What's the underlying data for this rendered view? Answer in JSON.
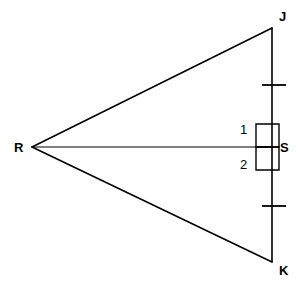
{
  "figure": {
    "type": "geometry-diagram",
    "background_color": "#ffffff",
    "stroke_color": "#000000",
    "canvas": {
      "width": 298,
      "height": 290
    }
  },
  "vertices": [
    {
      "id": "R",
      "label": "R",
      "x": 32,
      "y": 147,
      "label_x": 14,
      "label_y": 141
    },
    {
      "id": "J",
      "label": "J",
      "x": 272,
      "y": 28,
      "label_x": 279,
      "label_y": 10
    },
    {
      "id": "K",
      "label": "K",
      "x": 272,
      "y": 262,
      "label_x": 279,
      "label_y": 264
    },
    {
      "id": "S",
      "label": "S",
      "x": 272,
      "y": 147,
      "label_x": 280,
      "label_y": 141
    }
  ],
  "segments": [
    {
      "id": "RJ",
      "from": "R",
      "to": "J",
      "x1": 32,
      "y1": 147,
      "x2": 272,
      "y2": 28,
      "width": 1.6
    },
    {
      "id": "RK",
      "from": "R",
      "to": "K",
      "x1": 32,
      "y1": 147,
      "x2": 272,
      "y2": 262,
      "width": 1.6
    },
    {
      "id": "JK",
      "from": "J",
      "to": "K",
      "x1": 272,
      "y1": 28,
      "x2": 272,
      "y2": 262,
      "width": 1.6
    },
    {
      "id": "RS",
      "from": "R",
      "to": "S",
      "x1": 32,
      "y1": 147,
      "x2": 272,
      "y2": 147,
      "width": 1.2
    }
  ],
  "right_angle_marks": [
    {
      "id": "angle-1",
      "x": 256,
      "y": 124,
      "size": 23,
      "on_segment": "JS"
    },
    {
      "id": "angle-2",
      "x": 256,
      "y": 147,
      "size": 23,
      "on_segment": "SK"
    }
  ],
  "angle_labels": [
    {
      "id": "1",
      "label": "1",
      "x": 240,
      "y": 123
    },
    {
      "id": "2",
      "label": "2",
      "x": 240,
      "y": 158
    }
  ],
  "congruence_ticks": [
    {
      "id": "tick-JS",
      "segment": "JS",
      "x1": 262,
      "y1": 85,
      "x2": 286,
      "y2": 85,
      "count": 1
    },
    {
      "id": "tick-SK",
      "segment": "SK",
      "x1": 262,
      "y1": 206,
      "x2": 286,
      "y2": 206,
      "count": 1
    }
  ]
}
